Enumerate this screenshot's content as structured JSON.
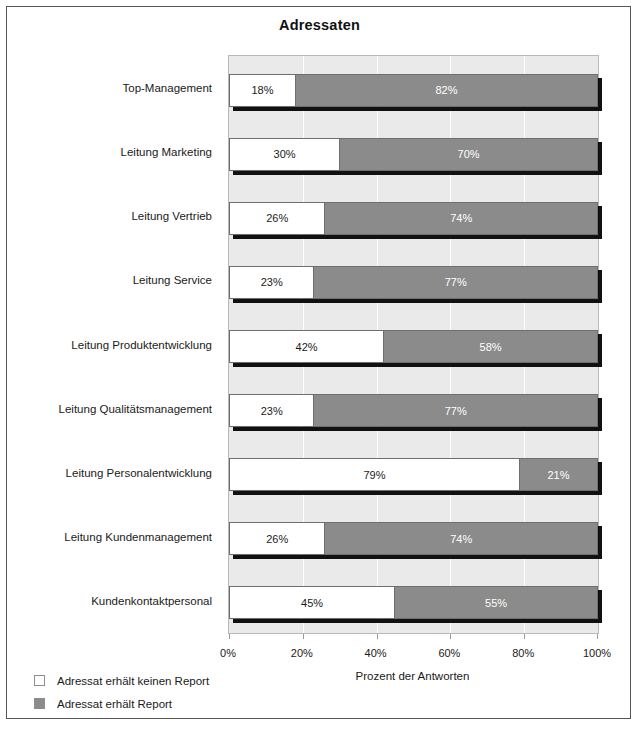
{
  "figure": {
    "title": "Adressaten",
    "frame_border_color": "#555555"
  },
  "chart_data": {
    "type": "bar",
    "orientation": "horizontal",
    "stacked": true,
    "stacked_mode": "percent",
    "title": "Adressaten",
    "xlabel": "Prozent der Antworten",
    "ylabel": "",
    "xlim": [
      0,
      100
    ],
    "xticks": [
      0,
      20,
      40,
      60,
      80,
      100
    ],
    "xticklabels": [
      "0%",
      "20%",
      "40%",
      "60%",
      "80%",
      "100%"
    ],
    "grid": "vertical",
    "legend_position": "bottom-left",
    "categories": [
      "Top-Management",
      "Leitung Marketing",
      "Leitung Vertrieb",
      "Leitung Service",
      "Leitung Produktentwicklung",
      "Leitung Qualitätsmanagement",
      "Leitung Personalentwicklung",
      "Leitung Kundenmanagement",
      "Kundenkontaktpersonal"
    ],
    "series": [
      {
        "name": "Adressat erhält keinen Report",
        "color": "#ffffff",
        "values": [
          18,
          30,
          26,
          23,
          42,
          23,
          79,
          26,
          45
        ],
        "labels": [
          "18%",
          "30%",
          "26%",
          "23%",
          "42%",
          "23%",
          "79%",
          "26%",
          "45%"
        ]
      },
      {
        "name": "Adressat erhält Report",
        "color": "#8b8b8b",
        "values": [
          82,
          70,
          74,
          77,
          58,
          77,
          21,
          74,
          55
        ],
        "labels": [
          "82%",
          "70%",
          "74%",
          "77%",
          "58%",
          "77%",
          "21%",
          "74%",
          "55%"
        ]
      }
    ],
    "plot_background": "#eaeaea",
    "gridline_color": "#ffffff"
  },
  "legend": {
    "items": [
      {
        "label": "Adressat erhält keinen Report",
        "swatch": "#ffffff"
      },
      {
        "label": "Adressat erhält Report",
        "swatch": "#8b8b8b"
      }
    ]
  }
}
